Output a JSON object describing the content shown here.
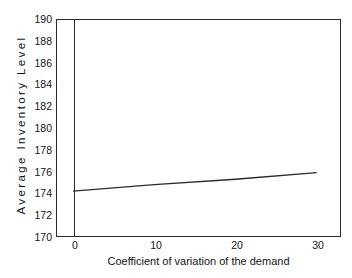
{
  "chart_data": {
    "type": "line",
    "title": "",
    "subtitle": "",
    "xlabel": "Coefficient of variation of the demand",
    "ylabel": "Average Inventory Level",
    "xlim": [
      -2.1,
      33.0
    ],
    "ylim": [
      170,
      190
    ],
    "xticks": [
      0,
      10,
      20,
      30
    ],
    "xticklabels": [
      "0",
      "10",
      "20",
      "30"
    ],
    "yticks": [
      170,
      172,
      174,
      176,
      178,
      180,
      182,
      184,
      186,
      188,
      190
    ],
    "yticklabels": [
      "170",
      "172",
      "174",
      "176",
      "178",
      "180",
      "182",
      "184",
      "186",
      "188",
      "190"
    ],
    "grid": false,
    "legend": false,
    "legend_position": "none",
    "line_color": "#2b2b2b",
    "frame_color": "#2b2b2b",
    "background_color": "#ffffff",
    "series": [
      {
        "name": "Average Inventory Level",
        "x": [
          0,
          10,
          20,
          30
        ],
        "values": [
          174.2,
          174.8,
          175.3,
          175.9
        ]
      }
    ],
    "annotations": []
  },
  "axes": {
    "y_title": "Average Inventory Level",
    "x_title": "Coefficient of variation of the demand"
  }
}
